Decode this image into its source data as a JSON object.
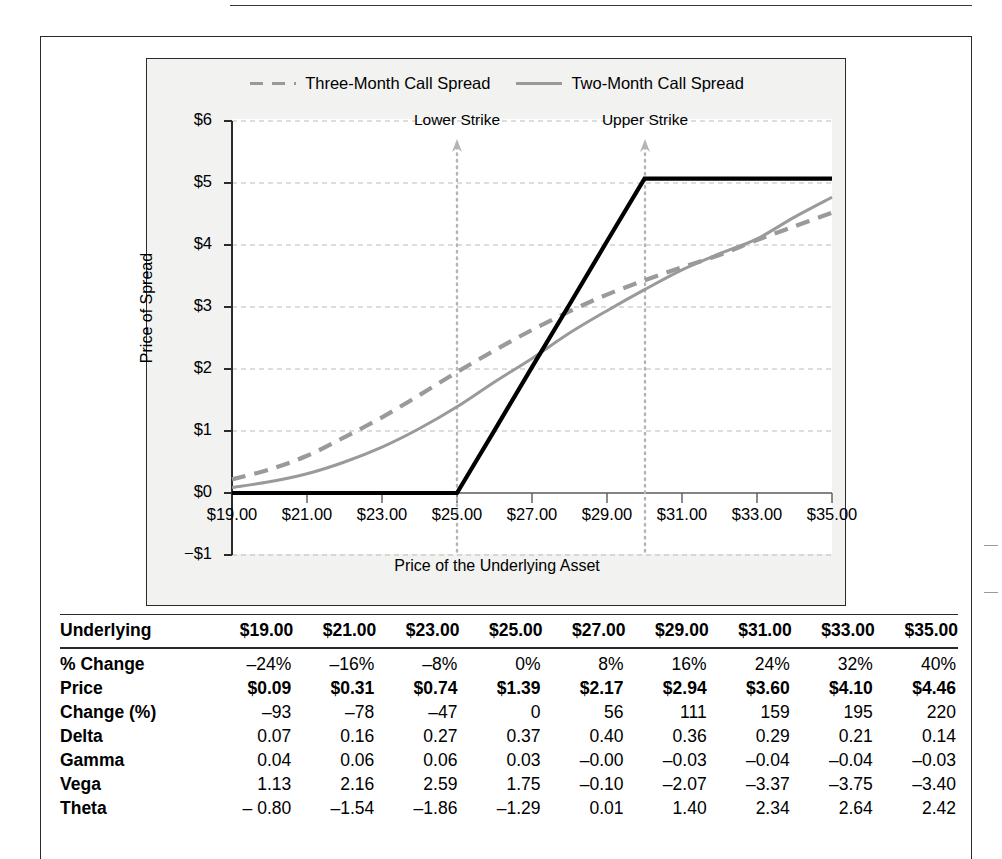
{
  "chart_data": {
    "type": "line",
    "title": "",
    "xlabel": "Price of the Underlying Asset",
    "ylabel": "Price of Spread",
    "xlim": [
      19,
      35
    ],
    "ylim": [
      -1,
      6
    ],
    "grid": true,
    "legend_position": "top-center",
    "xticks": [
      "$19.00",
      "$21.00",
      "$23.00",
      "$25.00",
      "$27.00",
      "$29.00",
      "$31.00",
      "$33.00",
      "$35.00"
    ],
    "yticks": [
      "$6",
      "$5",
      "$4",
      "$3",
      "$2",
      "$1",
      "$0",
      "−$1"
    ],
    "annotations": [
      {
        "label": "Lower Strike",
        "x": 25
      },
      {
        "label": "Upper Strike",
        "x": 30
      }
    ],
    "x": [
      19,
      20,
      21,
      22,
      23,
      24,
      25,
      26,
      27,
      28,
      29,
      30,
      31,
      32,
      33,
      34,
      35
    ],
    "series": [
      {
        "name": "Three-Month Call Spread",
        "style": "dashed",
        "color": "#9a9a9a",
        "values": [
          0.22,
          0.38,
          0.6,
          0.9,
          1.22,
          1.58,
          1.95,
          2.3,
          2.63,
          2.93,
          3.2,
          3.43,
          3.64,
          3.84,
          4.08,
          4.3,
          4.52
        ]
      },
      {
        "name": "Two-Month Call Spread",
        "style": "solid",
        "color": "#9a9a9a",
        "values": [
          0.09,
          0.18,
          0.31,
          0.5,
          0.74,
          1.04,
          1.39,
          1.79,
          2.17,
          2.58,
          2.94,
          3.28,
          3.6,
          3.86,
          4.1,
          4.45,
          4.77
        ]
      },
      {
        "name": "Payoff at Expiration",
        "style": "solid-black",
        "color": "#000000",
        "values": [
          0,
          0,
          0,
          0,
          0,
          0,
          0,
          1.01,
          2.03,
          3.04,
          4.06,
          5.07,
          5.07,
          5.07,
          5.07,
          5.07,
          5.07
        ]
      }
    ]
  },
  "legend": {
    "items": [
      {
        "label": "Three-Month Call Spread",
        "style": "dashed"
      },
      {
        "label": "Two-Month Call Spread",
        "style": "solid"
      }
    ]
  },
  "axes": {
    "ylabel": "Price of Spread",
    "xlabel": "Price of the Underlying Asset",
    "yticks": [
      "$6",
      "$5",
      "$4",
      "$3",
      "$2",
      "$1",
      "$0",
      "−$1"
    ],
    "xticks": [
      "$19.00",
      "$21.00",
      "$23.00",
      "$25.00",
      "$27.00",
      "$29.00",
      "$31.00",
      "$33.00",
      "$35.00"
    ]
  },
  "strikes": {
    "lower": "Lower Strike",
    "upper": "Upper Strike"
  },
  "table": {
    "header_label": "Underlying",
    "columns": [
      "$19.00",
      "$21.00",
      "$23.00",
      "$25.00",
      "$27.00",
      "$29.00",
      "$31.00",
      "$33.00",
      "$35.00"
    ],
    "rows": [
      {
        "label": "% Change",
        "bold_values": false,
        "values": [
          "–24%",
          "–16%",
          "–8%",
          "0%",
          "8%",
          "16%",
          "24%",
          "32%",
          "40%"
        ]
      },
      {
        "label": "Price",
        "bold_values": true,
        "values": [
          "$0.09",
          "$0.31",
          "$0.74",
          "$1.39",
          "$2.17",
          "$2.94",
          "$3.60",
          "$4.10",
          "$4.46"
        ]
      },
      {
        "label": "Change (%)",
        "bold_values": false,
        "values": [
          "–93",
          "–78",
          "–47",
          "0",
          "56",
          "111",
          "159",
          "195",
          "220"
        ]
      },
      {
        "label": "Delta",
        "bold_values": false,
        "values": [
          "0.07",
          "0.16",
          "0.27",
          "0.37",
          "0.40",
          "0.36",
          "0.29",
          "0.21",
          "0.14"
        ]
      },
      {
        "label": "Gamma",
        "bold_values": false,
        "values": [
          "0.04",
          "0.06",
          "0.06",
          "0.03",
          "–0.00",
          "–0.03",
          "–0.04",
          "–0.04",
          "–0.03"
        ]
      },
      {
        "label": "Vega",
        "bold_values": false,
        "values": [
          "1.13",
          "2.16",
          "2.59",
          "1.75",
          "–0.10",
          "–2.07",
          "–3.37",
          "–3.75",
          "–3.40"
        ]
      },
      {
        "label": "Theta",
        "bold_values": false,
        "values": [
          "– 0.80",
          "–1.54",
          "–1.86",
          "–1.29",
          "0.01",
          "1.40",
          "2.34",
          "2.64",
          "2.42"
        ]
      }
    ]
  }
}
